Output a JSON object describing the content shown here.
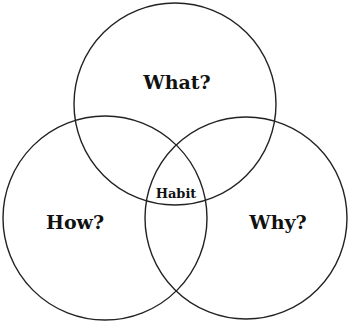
{
  "diagram": {
    "type": "venn",
    "stroke_color": "#222222",
    "background": "#ffffff",
    "circles": [
      {
        "id": "what",
        "label": "What?",
        "cx": 175,
        "cy": 104,
        "r": 101,
        "label_x": 177,
        "label_y": 82
      },
      {
        "id": "how",
        "label": "How?",
        "cx": 105,
        "cy": 218,
        "r": 102,
        "label_x": 75,
        "label_y": 222
      },
      {
        "id": "why",
        "label": "Why?",
        "cx": 246,
        "cy": 218,
        "r": 101,
        "label_x": 278,
        "label_y": 222
      }
    ],
    "intersection": {
      "label": "Habit",
      "x": 176,
      "y": 193
    }
  }
}
